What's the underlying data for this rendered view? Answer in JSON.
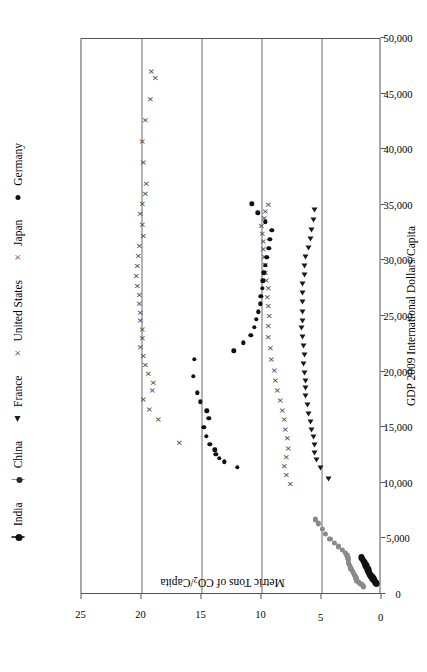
{
  "chart_data": {
    "type": "scatter",
    "title": "",
    "xlabel": "GDP 2009 International Dollars/Capita",
    "ylabel": "Metric Tons of CO2/Capita",
    "ylabel_main": "Metric Tons of CO",
    "ylabel_sub": "2",
    "ylabel_tail": "/Capita",
    "xlim": [
      0,
      50000
    ],
    "ylim": [
      0,
      25
    ],
    "xticks": [
      0,
      5000,
      10000,
      15000,
      20000,
      25000,
      30000,
      35000,
      40000,
      45000,
      50000
    ],
    "xtick_labels": [
      "0",
      "5,000",
      "10,000",
      "15,000",
      "20,000",
      "25,000",
      "30,000",
      "35,000",
      "40,000",
      "45,000",
      "50,000"
    ],
    "yticks": [
      0,
      5,
      10,
      15,
      20,
      25
    ],
    "ytick_labels": [
      "0",
      "5",
      "10",
      "15",
      "20",
      "25"
    ],
    "gridlines_y": [
      5,
      10,
      15,
      20
    ],
    "grid": "horizontal-only",
    "legend_position": "top",
    "series": [
      {
        "name": "India",
        "marker": "vline-dot",
        "color": "#111111",
        "points": [
          [
            820,
            0.43
          ],
          [
            900,
            0.47
          ],
          [
            980,
            0.52
          ],
          [
            1060,
            0.58
          ],
          [
            1140,
            0.63
          ],
          [
            1220,
            0.68
          ],
          [
            1300,
            0.72
          ],
          [
            1390,
            0.78
          ],
          [
            1470,
            0.83
          ],
          [
            1550,
            0.88
          ],
          [
            1640,
            0.93
          ],
          [
            1730,
            0.98
          ],
          [
            1820,
            1.02
          ],
          [
            1910,
            1.06
          ],
          [
            2010,
            1.1
          ],
          [
            2110,
            1.14
          ],
          [
            2220,
            1.19
          ],
          [
            2340,
            1.24
          ],
          [
            2460,
            1.3
          ],
          [
            2600,
            1.37
          ],
          [
            2740,
            1.44
          ],
          [
            2890,
            1.52
          ],
          [
            3050,
            1.6
          ],
          [
            3190,
            1.67
          ]
        ]
      },
      {
        "name": "China",
        "marker": "vline-dot",
        "color": "#8a8a8a",
        "points": [
          [
            520,
            1.48
          ],
          [
            620,
            1.52
          ],
          [
            700,
            1.6
          ],
          [
            790,
            1.72
          ],
          [
            880,
            1.85
          ],
          [
            980,
            1.95
          ],
          [
            1090,
            2.05
          ],
          [
            1210,
            2.1
          ],
          [
            1340,
            2.14
          ],
          [
            1480,
            2.18
          ],
          [
            1630,
            2.25
          ],
          [
            1790,
            2.32
          ],
          [
            1960,
            2.44
          ],
          [
            2140,
            2.55
          ],
          [
            2330,
            2.62
          ],
          [
            2520,
            2.7
          ],
          [
            2720,
            2.74
          ],
          [
            2930,
            2.78
          ],
          [
            3150,
            2.8
          ],
          [
            3380,
            2.88
          ],
          [
            3620,
            3.02
          ],
          [
            3880,
            3.28
          ],
          [
            4170,
            3.6
          ],
          [
            4500,
            3.95
          ],
          [
            4880,
            4.3
          ],
          [
            5300,
            4.65
          ],
          [
            5760,
            4.95
          ],
          [
            6240,
            5.28
          ],
          [
            6600,
            5.5
          ]
        ]
      },
      {
        "name": "France",
        "marker": "triangle-left",
        "color": "#1a1a1a",
        "points": [
          [
            10250,
            4.4
          ],
          [
            11200,
            5.1
          ],
          [
            12000,
            5.45
          ],
          [
            12600,
            5.55
          ],
          [
            13300,
            5.6
          ],
          [
            14000,
            5.7
          ],
          [
            14700,
            5.85
          ],
          [
            15400,
            5.95
          ],
          [
            16100,
            6.05
          ],
          [
            16900,
            6.2
          ],
          [
            17700,
            6.3
          ],
          [
            18400,
            6.35
          ],
          [
            19100,
            6.3
          ],
          [
            19800,
            6.45
          ],
          [
            20600,
            6.5
          ],
          [
            21400,
            6.45
          ],
          [
            22200,
            6.5
          ],
          [
            23000,
            6.6
          ],
          [
            23800,
            6.65
          ],
          [
            24500,
            6.6
          ],
          [
            25300,
            6.55
          ],
          [
            26200,
            6.62
          ],
          [
            27000,
            6.62
          ],
          [
            27800,
            6.6
          ],
          [
            28600,
            6.45
          ],
          [
            29400,
            6.4
          ],
          [
            30200,
            6.3
          ],
          [
            31000,
            6.05
          ],
          [
            31800,
            5.95
          ],
          [
            32600,
            5.85
          ],
          [
            33500,
            5.7
          ],
          [
            34400,
            5.55
          ]
        ]
      },
      {
        "name": "United States",
        "marker": "x",
        "color": "#4a4a4a",
        "points": [
          [
            13500,
            16.8
          ],
          [
            15600,
            18.6
          ],
          [
            16500,
            19.3
          ],
          [
            17400,
            19.8
          ],
          [
            18200,
            19.1
          ],
          [
            18900,
            19.0
          ],
          [
            19700,
            19.4
          ],
          [
            20500,
            19.7
          ],
          [
            21300,
            19.85
          ],
          [
            22100,
            20.1
          ],
          [
            22900,
            19.95
          ],
          [
            23700,
            19.95
          ],
          [
            24500,
            20.05
          ],
          [
            25200,
            20.1
          ],
          [
            26000,
            20.2
          ],
          [
            26800,
            20.15
          ],
          [
            27600,
            20.3
          ],
          [
            28500,
            20.4
          ],
          [
            29400,
            20.35
          ],
          [
            30300,
            20.25
          ],
          [
            31200,
            20.15
          ],
          [
            32100,
            19.85
          ],
          [
            33100,
            19.95
          ],
          [
            34100,
            20.1
          ],
          [
            35000,
            19.95
          ],
          [
            35900,
            19.7
          ],
          [
            36800,
            19.55
          ],
          [
            38700,
            19.85
          ],
          [
            40600,
            19.9
          ],
          [
            42500,
            19.65
          ],
          [
            44400,
            19.25
          ],
          [
            46300,
            18.8
          ],
          [
            46900,
            19.15
          ]
        ]
      },
      {
        "name": "Japan",
        "marker": "x",
        "color": "#4a4a4a",
        "points": [
          [
            9800,
            7.6
          ],
          [
            10600,
            7.9
          ],
          [
            11400,
            8.05
          ],
          [
            12200,
            7.9
          ],
          [
            13000,
            7.75
          ],
          [
            13900,
            7.85
          ],
          [
            14700,
            8.0
          ],
          [
            15600,
            8.1
          ],
          [
            16400,
            8.25
          ],
          [
            17300,
            8.45
          ],
          [
            18200,
            8.65
          ],
          [
            19100,
            8.8
          ],
          [
            20000,
            8.95
          ],
          [
            21000,
            9.15
          ],
          [
            22000,
            9.25
          ],
          [
            23000,
            9.4
          ],
          [
            24000,
            9.45
          ],
          [
            24900,
            9.35
          ],
          [
            25800,
            9.45
          ],
          [
            26600,
            9.5
          ],
          [
            27400,
            9.45
          ],
          [
            28100,
            9.55
          ],
          [
            28800,
            9.65
          ],
          [
            29500,
            9.7
          ],
          [
            30200,
            9.75
          ],
          [
            30900,
            9.8
          ],
          [
            31600,
            9.85
          ],
          [
            32300,
            9.9
          ],
          [
            33000,
            10.0
          ],
          [
            33700,
            9.75
          ],
          [
            34300,
            9.65
          ],
          [
            34900,
            9.4
          ]
        ]
      },
      {
        "name": "Germany",
        "marker": "dot",
        "color": "#111111",
        "points": [
          [
            11300,
            12.0
          ],
          [
            11800,
            13.1
          ],
          [
            12100,
            13.5
          ],
          [
            12500,
            13.8
          ],
          [
            12900,
            13.9
          ],
          [
            13400,
            14.3
          ],
          [
            14100,
            14.6
          ],
          [
            14900,
            14.8
          ],
          [
            15700,
            14.4
          ],
          [
            16400,
            14.55
          ],
          [
            17200,
            15.1
          ],
          [
            18000,
            15.35
          ],
          [
            19500,
            15.7
          ],
          [
            21000,
            15.6
          ],
          [
            21800,
            12.3
          ],
          [
            22500,
            11.5
          ],
          [
            23200,
            10.9
          ],
          [
            23900,
            10.6
          ],
          [
            24600,
            10.45
          ],
          [
            25300,
            10.25
          ],
          [
            26000,
            10.1
          ],
          [
            26700,
            10.05
          ],
          [
            27400,
            9.95
          ],
          [
            28100,
            9.9
          ],
          [
            28800,
            9.8
          ],
          [
            29500,
            9.7
          ],
          [
            30200,
            9.55
          ],
          [
            31000,
            9.4
          ],
          [
            31800,
            9.3
          ],
          [
            32600,
            9.15
          ],
          [
            33400,
            9.7
          ],
          [
            34200,
            10.3
          ],
          [
            35000,
            10.8
          ]
        ]
      }
    ]
  },
  "legend": {
    "items": [
      {
        "label": "India",
        "marker": "vline-dot"
      },
      {
        "label": "China",
        "marker": "vline-dot-gray"
      },
      {
        "label": "France",
        "marker": "triangle-left"
      },
      {
        "label": "United States",
        "marker": "x"
      },
      {
        "label": "Japan",
        "marker": "x"
      },
      {
        "label": "Germany",
        "marker": "dot"
      }
    ]
  }
}
